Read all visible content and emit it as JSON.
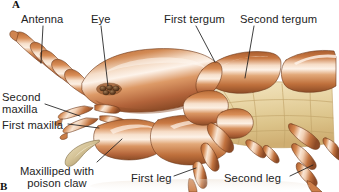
{
  "figure": {
    "panel_labels": [
      {
        "id": "A",
        "text": "A"
      },
      {
        "id": "B",
        "text": "B"
      }
    ],
    "background_color": "#ffffff"
  },
  "labels": {
    "antenna": "Antenna",
    "eye": "Eye",
    "first_tergum": "First tergum",
    "second_tergum": "Second tergum",
    "second_maxilla": "Second\nmaxilla",
    "second_maxilla_line1": "Second",
    "second_maxilla_line2": "maxilla",
    "first_maxilla": "First maxilla",
    "maxilliped_line1": "Maxilliped with",
    "maxilliped_line2": "poison claw",
    "first_leg": "First leg",
    "second_leg": "Second leg"
  },
  "colors": {
    "background": "#ffffff",
    "cuticle_mid": "#c9763f",
    "cuticle_light": "#f3cdae",
    "cuticle_highlight": "#fdf0e4",
    "cuticle_dark": "#93512a",
    "cuticle_shadow": "#73401f",
    "membrane_pale": "#e6d3a2",
    "membrane_pale_light": "#f5e8c6",
    "membrane_line": "#c4a86a",
    "claw": "#cdbc93",
    "claw_dark": "#8a7850",
    "ocellus": "#5a3a22",
    "leader_line": "#1d1d1d",
    "text": "#232323"
  },
  "anatomy_parts": [
    "antenna",
    "eye",
    "first tergum",
    "second tergum",
    "second maxilla",
    "first maxilla",
    "maxilliped with poison claw",
    "first leg",
    "second leg"
  ]
}
